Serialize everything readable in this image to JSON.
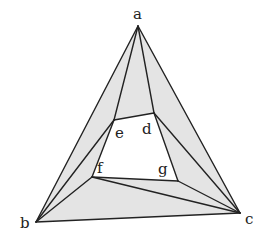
{
  "diagram": {
    "type": "planar-graph-triangulation",
    "colors": {
      "fill": "#e4e4e4",
      "inner": "#ffffff",
      "stroke": "#222222"
    },
    "vertices": {
      "a": {
        "x": 138,
        "y": 26,
        "label": "a",
        "lx": 133,
        "ly": 19
      },
      "b": {
        "x": 36,
        "y": 222,
        "label": "b",
        "lx": 20,
        "ly": 228
      },
      "c": {
        "x": 240,
        "y": 213,
        "label": "c",
        "lx": 245,
        "ly": 224
      },
      "d": {
        "x": 154,
        "y": 113,
        "label": "d",
        "lx": 142,
        "ly": 134
      },
      "e": {
        "x": 114,
        "y": 120,
        "label": "e",
        "lx": 115,
        "ly": 138
      },
      "f": {
        "x": 92,
        "y": 177,
        "label": "f",
        "lx": 97,
        "ly": 173
      },
      "g": {
        "x": 178,
        "y": 181,
        "label": "g",
        "lx": 158,
        "ly": 174
      }
    },
    "shaded_faces": [
      [
        "a",
        "b",
        "e"
      ],
      [
        "a",
        "e",
        "d"
      ],
      [
        "a",
        "d",
        "c"
      ],
      [
        "b",
        "e",
        "f"
      ],
      [
        "b",
        "f",
        "c"
      ],
      [
        "c",
        "d",
        "g"
      ],
      [
        "c",
        "g",
        "f"
      ]
    ],
    "inner_face": [
      "e",
      "d",
      "g",
      "f"
    ],
    "edges": [
      [
        "a",
        "b"
      ],
      [
        "a",
        "c"
      ],
      [
        "b",
        "c"
      ],
      [
        "a",
        "e"
      ],
      [
        "a",
        "d"
      ],
      [
        "b",
        "e"
      ],
      [
        "b",
        "f"
      ],
      [
        "c",
        "d"
      ],
      [
        "c",
        "g"
      ],
      [
        "c",
        "f"
      ],
      [
        "e",
        "d"
      ],
      [
        "d",
        "g"
      ],
      [
        "g",
        "f"
      ],
      [
        "f",
        "e"
      ]
    ]
  }
}
